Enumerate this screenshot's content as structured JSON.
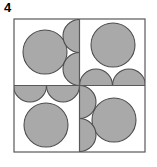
{
  "figure": {
    "label": "4",
    "title": ""
  },
  "colors": {
    "circle_fill": "#a9a9a9",
    "circle_stroke": "#4d4d4d",
    "square_stroke": "#595959",
    "divider_stroke": "#595959",
    "background": "#ffffff",
    "label_color": "#000000"
  },
  "geometry": {
    "square": {
      "x": 14,
      "y": 19,
      "width": 131,
      "height": 133
    },
    "divider_vertical_x": 79.5,
    "divider_horizontal_y": 85.5,
    "square_stroke_width": 1.2,
    "divider_stroke_width": 1.2,
    "circle_stroke_width": 1.1,
    "circle_radius_full": 22,
    "circle_radius_half": 16.5
  },
  "shapes": {
    "quadrants": [
      {
        "name": "top-left",
        "full_circles": [
          {
            "cx": 45,
            "cy": 52,
            "r": 22
          }
        ],
        "half_circles": [
          {
            "cx": 79.5,
            "cy": 36,
            "r": 16.5,
            "side": "left-of-vertical-divider"
          },
          {
            "cx": 79.5,
            "cy": 69,
            "r": 16.5,
            "side": "left-of-vertical-divider"
          }
        ]
      },
      {
        "name": "top-right",
        "full_circles": [
          {
            "cx": 113,
            "cy": 45,
            "r": 22
          }
        ],
        "half_circles": [
          {
            "cx": 96,
            "cy": 85.5,
            "r": 16.5,
            "side": "above-horizontal-divider"
          },
          {
            "cx": 129,
            "cy": 85.5,
            "r": 16.5,
            "side": "above-horizontal-divider"
          }
        ]
      },
      {
        "name": "bottom-left",
        "full_circles": [
          {
            "cx": 46,
            "cy": 125,
            "r": 22
          }
        ],
        "half_circles": [
          {
            "cx": 30,
            "cy": 85.5,
            "r": 16.5,
            "side": "below-horizontal-divider"
          },
          {
            "cx": 63,
            "cy": 85.5,
            "r": 16.5,
            "side": "below-horizontal-divider"
          }
        ]
      },
      {
        "name": "bottom-right",
        "full_circles": [
          {
            "cx": 114,
            "cy": 120,
            "r": 22
          }
        ],
        "half_circles": [
          {
            "cx": 79.5,
            "cy": 102,
            "r": 16.5,
            "side": "right-of-vertical-divider"
          },
          {
            "cx": 79.5,
            "cy": 135,
            "r": 16.5,
            "side": "right-of-vertical-divider"
          }
        ]
      }
    ],
    "counts": {
      "full_circles": 4,
      "half_circles": 8
    }
  }
}
